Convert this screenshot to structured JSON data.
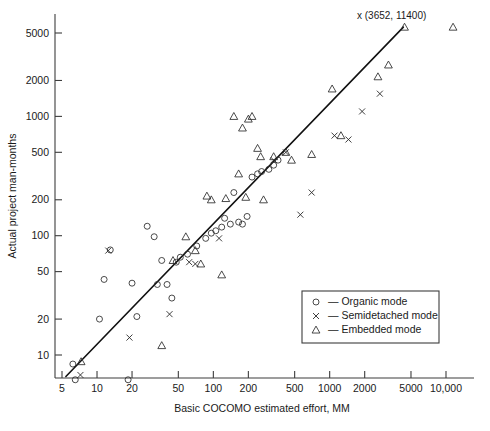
{
  "chart_data": {
    "type": "scatter",
    "title": "",
    "xlabel": "Basic COCOMO estimated effort, MM",
    "ylabel": "Actual project man-months",
    "xscale": "log",
    "yscale": "log",
    "xlim": [
      3.4,
      17000
    ],
    "ylim": [
      4.2,
      9000
    ],
    "grid": false,
    "xticks": [
      5,
      10,
      20,
      50,
      100,
      200,
      500,
      1000,
      2000,
      5000,
      10000
    ],
    "xticklabels": [
      "5",
      "10",
      "20",
      "50",
      "100",
      "200",
      "500",
      "1000",
      "2000",
      "5000",
      "10,000"
    ],
    "yticks": [
      10,
      20,
      50,
      100,
      200,
      500,
      1000,
      2000,
      5000
    ],
    "yticklabels": [
      "10",
      "20",
      "50",
      "100",
      "200",
      "500",
      "1000",
      "2000",
      "5000"
    ],
    "legend_position": "lower-right",
    "legend": [
      {
        "marker": "circle",
        "dash": "—",
        "label": "Organic mode"
      },
      {
        "marker": "x",
        "dash": "—",
        "label": "Semidetached mode"
      },
      {
        "marker": "triangle",
        "dash": "—",
        "label": "Embedded mode"
      }
    ],
    "annotations": [
      {
        "text": "x (3652, 11400)",
        "x": 3652,
        "y": 11400
      }
    ],
    "reference_line": {
      "label": "y = x",
      "from": [
        5.4,
        6.6
      ],
      "to": [
        4300,
        5600
      ]
    },
    "series": [
      {
        "name": "Organic mode",
        "marker": "circle",
        "points": [
          [
            6.2,
            8.4
          ],
          [
            6.5,
            6.2
          ],
          [
            7.0,
            5.2
          ],
          [
            8.0,
            4.8
          ],
          [
            9.0,
            4.6
          ],
          [
            10.5,
            20.0
          ],
          [
            11.5,
            43.0
          ],
          [
            13.0,
            76.0
          ],
          [
            14.0,
            5.0
          ],
          [
            16.5,
            6.1
          ],
          [
            18.5,
            6.2
          ],
          [
            20.0,
            40.0
          ],
          [
            22.0,
            21.0
          ],
          [
            27.0,
            120.0
          ],
          [
            31.0,
            98.0
          ],
          [
            33.0,
            39.0
          ],
          [
            36.0,
            62.0
          ],
          [
            40.0,
            39.0
          ],
          [
            44.0,
            30.0
          ],
          [
            48.0,
            60.0
          ],
          [
            52.0,
            66.0
          ],
          [
            60.0,
            70.0
          ],
          [
            72.0,
            82.0
          ],
          [
            86.0,
            95.0
          ],
          [
            96.0,
            105.0
          ],
          [
            105.0,
            110.0
          ],
          [
            118.0,
            118.0
          ],
          [
            125.0,
            140.0
          ],
          [
            140.0,
            125.0
          ],
          [
            150.0,
            230.0
          ],
          [
            165.0,
            130.0
          ],
          [
            178.0,
            125.0
          ],
          [
            195.0,
            145.0
          ],
          [
            215.0,
            310.0
          ],
          [
            240.0,
            330.0
          ],
          [
            260.0,
            345.0
          ],
          [
            300.0,
            360.0
          ],
          [
            330.0,
            390.0
          ],
          [
            360.0,
            430.0
          ]
        ]
      },
      {
        "name": "Semidetached mode",
        "marker": "x",
        "points": [
          [
            7.0,
            5.4
          ],
          [
            7.2,
            6.8
          ],
          [
            12.5,
            75.0
          ],
          [
            19.0,
            14.0
          ],
          [
            42.0,
            22.0
          ],
          [
            62.0,
            60.0
          ],
          [
            70.0,
            58.0
          ],
          [
            112.0,
            95.0
          ],
          [
            330.0,
            430.0
          ],
          [
            420.0,
            500.0
          ],
          [
            560.0,
            150.0
          ],
          [
            700.0,
            230.0
          ],
          [
            1100.0,
            690.0
          ],
          [
            1450.0,
            640.0
          ],
          [
            1900.0,
            1100.0
          ],
          [
            2700.0,
            1550.0
          ],
          [
            3652.0,
            11400.0
          ]
        ]
      },
      {
        "name": "Embedded mode",
        "marker": "triangle",
        "points": [
          [
            7.3,
            8.8
          ],
          [
            36.0,
            12.0
          ],
          [
            45.0,
            62.0
          ],
          [
            58.0,
            98.0
          ],
          [
            70.0,
            75.0
          ],
          [
            78.0,
            58.0
          ],
          [
            88.0,
            215.0
          ],
          [
            96.0,
            200.0
          ],
          [
            118.0,
            47.0
          ],
          [
            128.0,
            205.0
          ],
          [
            150.0,
            1000.0
          ],
          [
            165.0,
            330.0
          ],
          [
            178.0,
            800.0
          ],
          [
            190.0,
            210.0
          ],
          [
            200.0,
            950.0
          ],
          [
            215.0,
            1000.0
          ],
          [
            240.0,
            540.0
          ],
          [
            255.0,
            460.0
          ],
          [
            270.0,
            200.0
          ],
          [
            330.0,
            460.0
          ],
          [
            420.0,
            500.0
          ],
          [
            470.0,
            430.0
          ],
          [
            700.0,
            480.0
          ],
          [
            1050.0,
            1700.0
          ],
          [
            1250.0,
            690.0
          ],
          [
            2600.0,
            2150.0
          ],
          [
            3200.0,
            2700.0
          ],
          [
            4400.0,
            5600.0
          ],
          [
            11500.0,
            5600.0
          ]
        ]
      }
    ]
  }
}
